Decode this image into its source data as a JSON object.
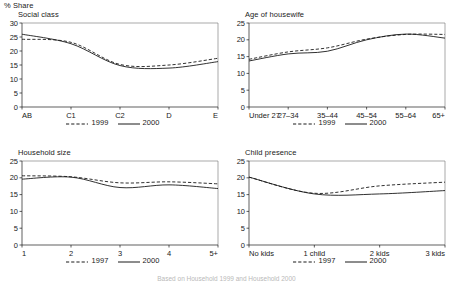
{
  "figure": {
    "unit_label": "% Share",
    "caption": "Based on Household 1999 and Household 2000"
  },
  "chart_data": [
    {
      "id": "social-class",
      "type": "line",
      "title": "Social class",
      "xlabel": "",
      "ylabel": "% Share",
      "categories": [
        "AB",
        "C1",
        "C2",
        "D",
        "E"
      ],
      "ylim": [
        0,
        30
      ],
      "yticks": [
        0,
        5,
        10,
        15,
        20,
        25,
        30
      ],
      "grid": false,
      "legend_position": "bottom",
      "series": [
        {
          "name": "1999",
          "style": "dashed",
          "values": [
            24.2,
            23.1,
            15.2,
            15.0,
            17.4
          ]
        },
        {
          "name": "2000",
          "style": "solid",
          "values": [
            26.0,
            22.6,
            14.8,
            13.9,
            16.2
          ]
        }
      ]
    },
    {
      "id": "age-of-housewife",
      "type": "line",
      "title": "Age of housewife",
      "xlabel": "",
      "ylabel": "% Share",
      "categories": [
        "Under 27",
        "27–34",
        "35–44",
        "45–54",
        "55–64",
        "65+"
      ],
      "ylim": [
        0,
        25
      ],
      "yticks": [
        0,
        5,
        10,
        15,
        20,
        25
      ],
      "grid": false,
      "legend_position": "bottom",
      "series": [
        {
          "name": "1999",
          "style": "dashed",
          "values": [
            14.2,
            16.4,
            17.6,
            20.2,
            21.6,
            21.6
          ]
        },
        {
          "name": "2000",
          "style": "solid",
          "values": [
            13.7,
            15.8,
            16.6,
            20.0,
            21.7,
            20.5
          ]
        }
      ]
    },
    {
      "id": "household-size",
      "type": "line",
      "title": "Household size",
      "xlabel": "",
      "ylabel": "% Share",
      "categories": [
        "1",
        "2",
        "3",
        "4",
        "5+"
      ],
      "ylim": [
        0,
        25
      ],
      "yticks": [
        0,
        5,
        10,
        15,
        20,
        25
      ],
      "grid": false,
      "legend_position": "bottom",
      "series": [
        {
          "name": "1997",
          "style": "dashed",
          "values": [
            20.6,
            20.3,
            18.5,
            18.8,
            18.2
          ]
        },
        {
          "name": "2000",
          "style": "solid",
          "values": [
            19.6,
            20.2,
            17.1,
            17.9,
            16.8
          ]
        }
      ]
    },
    {
      "id": "child-presence",
      "type": "line",
      "title": "Child presence",
      "xlabel": "",
      "ylabel": "% Share",
      "categories": [
        "No kids",
        "1 child",
        "2 kids",
        "3 kids"
      ],
      "ylim": [
        0,
        25
      ],
      "yticks": [
        0,
        5,
        10,
        15,
        20,
        25
      ],
      "grid": false,
      "legend_position": "bottom",
      "series": [
        {
          "name": "1997",
          "style": "dashed",
          "values": [
            20.2,
            15.4,
            17.6,
            18.7
          ]
        },
        {
          "name": "2000",
          "style": "solid",
          "values": [
            20.2,
            15.2,
            15.2,
            16.2
          ]
        }
      ]
    }
  ]
}
